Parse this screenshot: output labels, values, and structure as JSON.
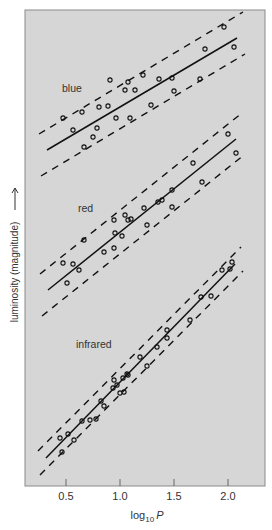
{
  "chart_data": {
    "type": "scatter",
    "title": "",
    "xlabel": "log10 P",
    "xlabel_main": "log",
    "xlabel_sub": "10",
    "xlabel_var": "P",
    "ylabel": "luminosity (magnitude) →",
    "ylabel_text": "luminosity (magnitude)",
    "xlim": [
      0.15,
      2.35
    ],
    "x_ticks": [
      0.5,
      1.0,
      1.5,
      2.0
    ],
    "x_tick_labels": [
      "0.5",
      "1.0",
      "1.5",
      "2.0"
    ],
    "grid": false,
    "legend": "none (inline band labels)",
    "background": "#d6d6d6",
    "series": [
      {
        "name": "blue",
        "label_pos": [
          62,
          92
        ],
        "fit": [
          [
            47,
            150
          ],
          [
            237,
            38
          ]
        ],
        "band_offset": 22,
        "points": [
          [
            63,
            118
          ],
          [
            73,
            130
          ],
          [
            82,
            112
          ],
          [
            84,
            147
          ],
          [
            93,
            137
          ],
          [
            97,
            128
          ],
          [
            99,
            107
          ],
          [
            108,
            106
          ],
          [
            110,
            80
          ],
          [
            116,
            118
          ],
          [
            125,
            90
          ],
          [
            130,
            118
          ],
          [
            128,
            82
          ],
          [
            135,
            90
          ],
          [
            143,
            75
          ],
          [
            151,
            105
          ],
          [
            159,
            79
          ],
          [
            172,
            78
          ],
          [
            174,
            91
          ],
          [
            200,
            79
          ],
          [
            205,
            49
          ],
          [
            224,
            27
          ],
          [
            234,
            47
          ]
        ]
      },
      {
        "name": "red",
        "label_pos": [
          78,
          212
        ],
        "fit": [
          [
            48,
            290
          ],
          [
            236,
            139
          ]
        ],
        "band_offset": 22,
        "points": [
          [
            63,
            263
          ],
          [
            67,
            283
          ],
          [
            73,
            264
          ],
          [
            79,
            270
          ],
          [
            84,
            240
          ],
          [
            104,
            252
          ],
          [
            114,
            248
          ],
          [
            114,
            220
          ],
          [
            115,
            233
          ],
          [
            122,
            236
          ],
          [
            125,
            215
          ],
          [
            128,
            220
          ],
          [
            131,
            219
          ],
          [
            144,
            208
          ],
          [
            147,
            225
          ],
          [
            158,
            202
          ],
          [
            162,
            200
          ],
          [
            172,
            190
          ],
          [
            172,
            207
          ],
          [
            193,
            163
          ],
          [
            202,
            182
          ],
          [
            228,
            134
          ],
          [
            236,
            153
          ]
        ]
      },
      {
        "name": "infrared",
        "label_pos": [
          76,
          348
        ],
        "fit": [
          [
            46,
            458
          ],
          [
            235,
            264
          ]
        ],
        "band_offset": 13,
        "points": [
          [
            60,
            438
          ],
          [
            62,
            452
          ],
          [
            68,
            434
          ],
          [
            74,
            440
          ],
          [
            82,
            421
          ],
          [
            90,
            420
          ],
          [
            96,
            419
          ],
          [
            101,
            401
          ],
          [
            104,
            406
          ],
          [
            113,
            388
          ],
          [
            114,
            380
          ],
          [
            117,
            385
          ],
          [
            120,
            393
          ],
          [
            123,
            378
          ],
          [
            124,
            392
          ],
          [
            127,
            374
          ],
          [
            128,
            375
          ],
          [
            140,
            357
          ],
          [
            147,
            366
          ],
          [
            157,
            347
          ],
          [
            167,
            330
          ],
          [
            167,
            338
          ],
          [
            190,
            320
          ],
          [
            201,
            297
          ],
          [
            211,
            296
          ],
          [
            222,
            270
          ],
          [
            230,
            269
          ],
          [
            232,
            262
          ]
        ]
      }
    ]
  }
}
